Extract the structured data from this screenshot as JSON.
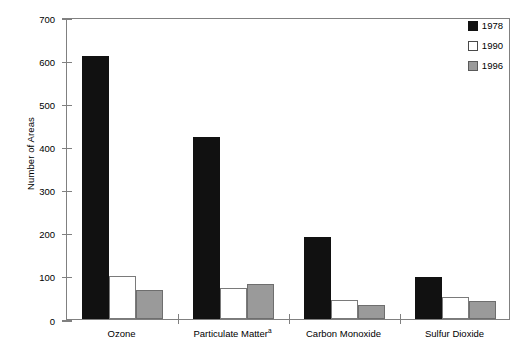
{
  "chart_data": {
    "type": "bar",
    "title": "",
    "subtitle": "",
    "xlabel": "",
    "ylabel": "Number of Areas",
    "ylim": [
      0,
      700
    ],
    "ytick_step": 100,
    "yticks": [
      700,
      600,
      500,
      400,
      300,
      200,
      100,
      0
    ],
    "ytick_labels": [
      "700",
      "600",
      "500",
      "400",
      "300",
      "200",
      "100",
      "0"
    ],
    "grid": false,
    "legend_position": "top-right",
    "categories": [
      "Ozone",
      "Particulate Matter",
      "Carbon Monoxide",
      "Sulfur Dioxide"
    ],
    "category_labels": [
      "Ozone",
      "Particulate Matter",
      "Carbon Monoxide",
      "Sulfur Dioxide"
    ],
    "category_footnotes": [
      "",
      "a",
      "",
      ""
    ],
    "series": [
      {
        "name": "1978",
        "color": "#111111",
        "values": [
          610,
          422,
          190,
          98
        ]
      },
      {
        "name": "1990",
        "color": "#ffffff",
        "values": [
          100,
          72,
          43,
          52
        ]
      },
      {
        "name": "1996",
        "color": "#9a9a9a",
        "values": [
          68,
          82,
          32,
          42
        ]
      }
    ]
  },
  "legend": {
    "items": [
      {
        "label": "1978",
        "swatch": "black-square-icon"
      },
      {
        "label": "1990",
        "swatch": "white-square-icon"
      },
      {
        "label": "1996",
        "swatch": "gray-square-icon"
      }
    ]
  },
  "axes": {
    "y_title": "Number of Areas"
  }
}
